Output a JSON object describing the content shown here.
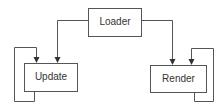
{
  "diagram": {
    "type": "flowchart",
    "nodes": [
      {
        "id": "loader",
        "label": "Loader"
      },
      {
        "id": "update",
        "label": "Update"
      },
      {
        "id": "render",
        "label": "Render"
      }
    ],
    "edges": [
      {
        "from": "loader",
        "to": "update"
      },
      {
        "from": "loader",
        "to": "render"
      },
      {
        "from": "update",
        "to": "update",
        "kind": "self-loop"
      },
      {
        "from": "render",
        "to": "render",
        "kind": "self-loop"
      }
    ],
    "colors": {
      "stroke": "#555555",
      "text": "#333333",
      "background": "#ffffff"
    }
  }
}
